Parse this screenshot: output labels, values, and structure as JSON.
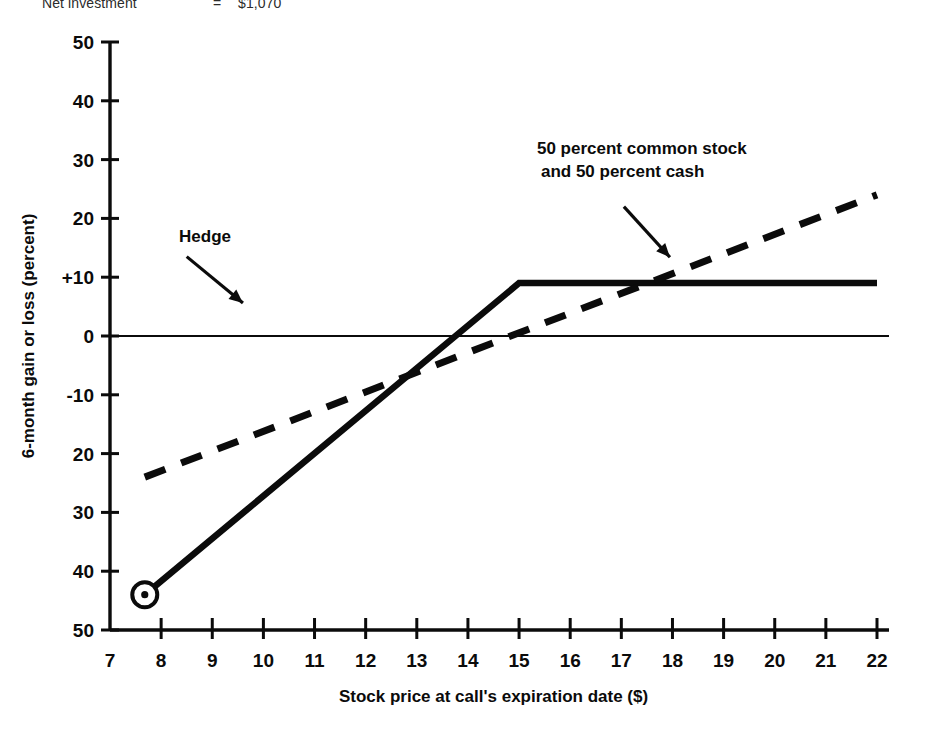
{
  "header": {
    "label": "Net investment",
    "equals": "=",
    "value": "$1,070"
  },
  "chart_data": {
    "type": "line",
    "title": "",
    "xlabel": "Stock price at call's expiration date ($)",
    "ylabel": "6-month gain or loss (percent)",
    "xlim": [
      7,
      22
    ],
    "ylim": [
      -50,
      50
    ],
    "grid": false,
    "legend_position": "none",
    "x_ticks": [
      7,
      8,
      9,
      10,
      11,
      12,
      13,
      14,
      15,
      16,
      17,
      18,
      19,
      20,
      21,
      22
    ],
    "x_tick_labels": [
      "7",
      "8",
      "9",
      "10",
      "11",
      "12",
      "13",
      "14",
      "15",
      "16",
      "17",
      "18",
      "19",
      "20",
      "21",
      "22"
    ],
    "y_ticks": [
      50,
      40,
      30,
      20,
      10,
      0,
      -10,
      -20,
      -30,
      -40,
      -50
    ],
    "y_tick_labels": [
      "50",
      "40",
      "30",
      "20",
      "+10",
      "0",
      "-10",
      "20",
      "30",
      "40",
      "50"
    ],
    "zero_line": 0,
    "series": [
      {
        "name": "Hedge",
        "style": "solid",
        "x": [
          7.68,
          15.0,
          22.0
        ],
        "values": [
          -44.0,
          9.0,
          9.0
        ],
        "marker": {
          "x": 7.68,
          "y": -44.0,
          "shape": "circled-dot"
        }
      },
      {
        "name": "50 percent common stock and 50 percent cash",
        "style": "dashed",
        "x": [
          7.68,
          22.0
        ],
        "values": [
          -24.0,
          24.0
        ]
      }
    ],
    "annotations": [
      {
        "name": "hedge-annotation",
        "text": "Hedge",
        "text_x": 8.35,
        "text_y": 16.0,
        "arrow_from": {
          "x": 8.5,
          "y": 13.5
        },
        "arrow_to": {
          "x": 9.6,
          "y": 5.6
        }
      },
      {
        "name": "mixed-annotation",
        "line1": "50 percent common stock",
        "line2": "and 50 percent cash",
        "text_x": 15.35,
        "text_y": 31.0,
        "arrow_from": {
          "x": 17.05,
          "y": 22.0
        },
        "arrow_to": {
          "x": 17.95,
          "y": 13.4
        }
      }
    ]
  }
}
